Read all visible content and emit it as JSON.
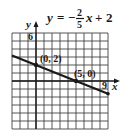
{
  "chart_data": {
    "type": "line",
    "title": {
      "lhs": "y",
      "equals": "=",
      "sign": "−",
      "numerator": "2",
      "denominator": "5",
      "var": "x",
      "plus": "+",
      "constant": "2"
    },
    "equation": "y = -2/5 x + 2",
    "slope": -0.4,
    "intercept": 2,
    "xlabel": "x",
    "ylabel": "y",
    "xlim": [
      -3,
      9
    ],
    "ylim": [
      -6,
      6
    ],
    "grid": true,
    "x_tick_labels": [
      {
        "value": 9,
        "label": "9"
      }
    ],
    "y_tick_labels": [
      {
        "value": 6,
        "label": "6"
      }
    ],
    "series": [
      {
        "name": "y = -2/5x + 2",
        "x": [
          -3,
          9
        ],
        "y": [
          3.2,
          -1.6
        ]
      }
    ],
    "points": [
      {
        "x": 0,
        "y": 2,
        "label": "(0, 2)"
      },
      {
        "x": 5,
        "y": 0,
        "label": "(5, 0)"
      }
    ],
    "colors": {
      "ink": "#1a1a1a",
      "grid": "#444444"
    }
  }
}
